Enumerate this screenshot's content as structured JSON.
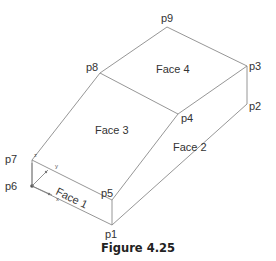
{
  "figure": {
    "caption": "Figure 4.25",
    "points": {
      "p1": "p1",
      "p2": "p2",
      "p3": "p3",
      "p4": "p4",
      "p5": "p5",
      "p6": "p6",
      "p7": "p7",
      "p8": "p8",
      "p9": "p9"
    },
    "faces": {
      "face1": "Face 1",
      "face2": "Face 2",
      "face3": "Face 3",
      "face4": "Face 4"
    },
    "axes": {
      "x": "x",
      "y": "y",
      "z": "z"
    },
    "colors": {
      "edge": "#8a8a8a",
      "text": "#333333"
    }
  }
}
